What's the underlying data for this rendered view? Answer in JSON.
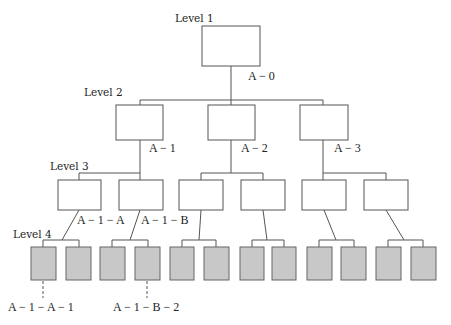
{
  "diagram": {
    "type": "hierarchy-tree",
    "colors": {
      "box_stroke": "#555555",
      "leaf_fill": "#c8c8c8",
      "background": "#ffffff"
    },
    "levels": [
      {
        "label": "Level 1"
      },
      {
        "label": "Level 2"
      },
      {
        "label": "Level 3"
      },
      {
        "label": "Level 4"
      }
    ],
    "node_labels": {
      "root": "A − 0",
      "l2_1": "A − 1",
      "l2_2": "A − 2",
      "l2_3": "A − 3",
      "l3_1": "A − 1 − A",
      "l3_2": "A − 1 − B",
      "l4_1": "A − 1 − A − 1",
      "l4_4": "A − 1 − B − 2"
    },
    "structure": {
      "root_children": 3,
      "level2_children_each": 2,
      "level3_children_each": 2,
      "level4_leaf_count": 12
    }
  }
}
